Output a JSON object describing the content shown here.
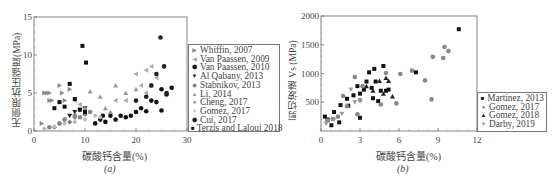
{
  "figure_a": {
    "caption": "(a)",
    "ylabel": "无侧限抗压强度(MPa)",
    "xlabel": "碳酸钙含量(%)",
    "xticks": [
      "0",
      "10",
      "20",
      "30"
    ],
    "yticks": [
      "0",
      "5",
      "10",
      "15"
    ],
    "legend": [
      {
        "label": "Whiffin, 2007",
        "marker": "▶",
        "color": "#888888"
      },
      {
        "label": "Van Paassen, 2009",
        "marker": "◀",
        "color": "#aaaaaa"
      },
      {
        "label": "Van Paassen, 2010",
        "marker": "⬢",
        "color": "#111111"
      },
      {
        "label": "Al Qabany, 2013",
        "marker": "▼",
        "color": "#222222"
      },
      {
        "label": "Stabnikov, 2013",
        "marker": "◆",
        "color": "#777777"
      },
      {
        "label": "Li, 2014",
        "marker": "▲",
        "color": "#999999"
      },
      {
        "label": "Cheng, 2017",
        "marker": "●",
        "color": "#888888"
      },
      {
        "label": "Gomez, 2017",
        "marker": "✦",
        "color": "#bbbbbb"
      },
      {
        "label": "Cui, 2017",
        "marker": "⬣",
        "color": "#222222"
      },
      {
        "label": "Terzis and Laloui 2018",
        "marker": "■",
        "color": "#111111"
      }
    ]
  },
  "figure_b": {
    "caption": "(b)",
    "ylabel": "剪切波速 Vs (MPa)",
    "xlabel": "碳酸钙含量(%)",
    "xticks": [
      "0",
      "3",
      "6",
      "9",
      "12"
    ],
    "yticks": [
      "500",
      "1000",
      "1500",
      "2000"
    ],
    "legend": [
      {
        "label": "Martinez, 2013",
        "marker": "■",
        "color": "#111111"
      },
      {
        "label": "Gomez, 2017",
        "marker": "●",
        "color": "#888888"
      },
      {
        "label": "Gomez, 2018",
        "marker": "▲",
        "color": "#222222"
      },
      {
        "label": "Darby, 2019",
        "marker": "▼",
        "color": "#999999"
      }
    ]
  },
  "chart_data": [
    {
      "type": "scatter",
      "title": "(a)",
      "xlabel": "碳酸钙含量(%)",
      "ylabel": "无侧限抗压强度(MPa)",
      "xlim": [
        0,
        30
      ],
      "ylim": [
        0,
        15
      ],
      "grid": false,
      "legend_position": "right",
      "series": [
        {
          "name": "Whiffin, 2007",
          "points": [
            [
              2,
              5
            ],
            [
              2.5,
              5
            ],
            [
              3,
              5
            ],
            [
              3,
              4
            ],
            [
              3.5,
              4
            ],
            [
              5,
              6
            ],
            [
              5.5,
              5
            ],
            [
              7,
              5.5
            ],
            [
              6,
              4
            ],
            [
              1.5,
              1
            ]
          ]
        },
        {
          "name": "Van Paassen, 2009",
          "points": [
            [
              8,
              4
            ],
            [
              9,
              3.5
            ],
            [
              10,
              3
            ],
            [
              16,
              4
            ],
            [
              18,
              4
            ],
            [
              20,
              7.5
            ],
            [
              21,
              6
            ],
            [
              22,
              8
            ],
            [
              23,
              8.5
            ],
            [
              24,
              7
            ],
            [
              22,
              5
            ]
          ]
        },
        {
          "name": "Van Paassen, 2010",
          "points": [
            [
              12,
              1
            ],
            [
              13,
              1.5
            ],
            [
              13.5,
              2
            ],
            [
              14,
              1.2
            ],
            [
              15,
              2
            ],
            [
              16,
              1.5
            ],
            [
              17,
              2
            ],
            [
              18,
              1.8
            ],
            [
              19,
              2
            ],
            [
              20,
              2.5
            ],
            [
              21,
              3
            ],
            [
              22,
              2.6
            ],
            [
              23,
              4
            ],
            [
              24,
              3.8
            ],
            [
              25,
              5.5
            ],
            [
              26,
              4.8
            ],
            [
              27,
              5.7
            ],
            [
              25,
              2.7
            ]
          ]
        },
        {
          "name": "Al Qabany, 2013",
          "points": [
            [
              7,
              2
            ],
            [
              8,
              2.5
            ],
            [
              9,
              2.8
            ],
            [
              10,
              3
            ]
          ]
        },
        {
          "name": "Stabnikov, 2013",
          "points": [
            [
              4,
              0.5
            ],
            [
              5,
              1
            ],
            [
              6,
              1.5
            ],
            [
              7,
              1.2
            ],
            [
              8,
              1.8
            ]
          ]
        },
        {
          "name": "Li, 2014",
          "points": [
            [
              10,
              3
            ],
            [
              11,
              5.2
            ],
            [
              13,
              4.5
            ],
            [
              14,
              3
            ],
            [
              16,
              6
            ],
            [
              18,
              5
            ],
            [
              20,
              5.5
            ],
            [
              23,
              6
            ],
            [
              15,
              2.5
            ]
          ]
        },
        {
          "name": "Cheng, 2017",
          "points": [
            [
              3,
              0.5
            ],
            [
              5,
              1
            ],
            [
              6,
              1.5
            ],
            [
              8,
              2
            ],
            [
              9,
              1.8
            ],
            [
              10,
              2.2
            ],
            [
              11,
              2.5
            ]
          ]
        },
        {
          "name": "Gomez, 2017",
          "points": [
            [
              2,
              0.3
            ],
            [
              4,
              0.6
            ],
            [
              6,
              1
            ],
            [
              8,
              1.2
            ],
            [
              10,
              1.5
            ],
            [
              12,
              2
            ],
            [
              13,
              1.8
            ]
          ]
        },
        {
          "name": "Cui, 2017",
          "points": [
            [
              20,
              4
            ],
            [
              22,
              4.5
            ],
            [
              23,
              6
            ],
            [
              24,
              7.5
            ],
            [
              24.8,
              12.3
            ],
            [
              25.5,
              8.5
            ],
            [
              26,
              5
            ]
          ]
        },
        {
          "name": "Terzis and Laloui 2018",
          "points": [
            [
              9.5,
              11.2
            ],
            [
              10.2,
              9
            ],
            [
              7,
              6.2
            ],
            [
              4,
              3
            ],
            [
              5,
              3.8
            ],
            [
              6,
              3.2
            ],
            [
              8,
              4.2
            ],
            [
              9,
              2.8
            ],
            [
              10,
              2.5
            ]
          ]
        }
      ]
    },
    {
      "type": "scatter",
      "title": "(b)",
      "xlabel": "碳酸钙含量(%)",
      "ylabel": "剪切波速 Vs (MPa)",
      "xlim": [
        0,
        12
      ],
      "ylim": [
        0,
        2000
      ],
      "grid": false,
      "legend_position": "lower right",
      "series": [
        {
          "name": "Martinez, 2013",
          "points": [
            [
              0.3,
              250
            ],
            [
              0.5,
              200
            ],
            [
              0.8,
              100
            ],
            [
              1,
              330
            ],
            [
              1.4,
              150
            ],
            [
              1.5,
              450
            ],
            [
              2,
              560
            ],
            [
              2.1,
              440
            ],
            [
              2.5,
              620
            ],
            [
              2.8,
              780
            ],
            [
              3,
              650
            ],
            [
              3,
              230
            ],
            [
              3.3,
              720
            ],
            [
              3.5,
              860
            ],
            [
              3.7,
              1020
            ],
            [
              3.9,
              750
            ],
            [
              4,
              570
            ],
            [
              4.1,
              1080
            ],
            [
              4.2,
              860
            ],
            [
              4.4,
              520
            ],
            [
              4.6,
              700
            ],
            [
              4.8,
              1130
            ],
            [
              5,
              700
            ],
            [
              5.2,
              720
            ],
            [
              7.3,
              1020
            ],
            [
              10.6,
              1770
            ]
          ]
        },
        {
          "name": "Gomez, 2017",
          "points": [
            [
              0.5,
              180
            ],
            [
              0.9,
              210
            ],
            [
              1.3,
              250
            ],
            [
              1.7,
              610
            ],
            [
              2,
              430
            ],
            [
              2.6,
              940
            ],
            [
              2.8,
              290
            ],
            [
              3,
              540
            ],
            [
              3.2,
              780
            ],
            [
              4.6,
              460
            ],
            [
              5,
              1010
            ],
            [
              5.8,
              480
            ],
            [
              6.1,
              990
            ],
            [
              7,
              1050
            ],
            [
              8,
              880
            ],
            [
              8.5,
              550
            ],
            [
              8.6,
              1290
            ],
            [
              9.4,
              1270
            ],
            [
              9.5,
              1460
            ],
            [
              9.8,
              1390
            ]
          ]
        },
        {
          "name": "Gomez, 2018",
          "points": [
            [
              3.5,
              780
            ],
            [
              4,
              700
            ],
            [
              4.5,
              870
            ],
            [
              4.8,
              650
            ],
            [
              5,
              920
            ],
            [
              5.2,
              870
            ],
            [
              5.5,
              600
            ]
          ]
        },
        {
          "name": "Darby, 2019",
          "points": [
            [
              0.4,
              130
            ],
            [
              1,
              200
            ],
            [
              1.6,
              300
            ],
            [
              2.3,
              720
            ],
            [
              2.6,
              500
            ],
            [
              3,
              520
            ]
          ]
        }
      ]
    }
  ]
}
